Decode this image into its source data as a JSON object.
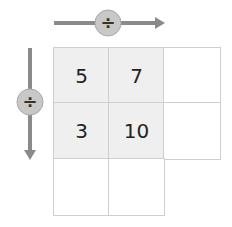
{
  "operations": {
    "horizontal": {
      "symbol": "÷",
      "direction": "right"
    },
    "vertical": {
      "symbol": "÷",
      "direction": "down"
    }
  },
  "grid": {
    "rows": [
      [
        {
          "value": "5",
          "shaded": true
        },
        {
          "value": "7",
          "shaded": true
        },
        {
          "value": "",
          "shaded": false
        }
      ],
      [
        {
          "value": "3",
          "shaded": true
        },
        {
          "value": "10",
          "shaded": true
        },
        {
          "value": "",
          "shaded": false
        }
      ],
      [
        {
          "value": "",
          "shaded": false
        },
        {
          "value": "",
          "shaded": false
        }
      ]
    ]
  },
  "colors": {
    "arrow": "#8a8a8a",
    "circle_fill": "#c8c8c8",
    "cell_shaded": "#efefef",
    "cell_border": "#cfcfcf"
  }
}
